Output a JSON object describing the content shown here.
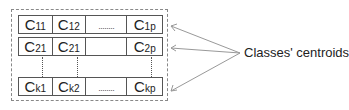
{
  "diagram": {
    "rows": [
      {
        "cells": [
          {
            "base": "C",
            "sub": "11"
          },
          {
            "base": "C",
            "sub": "12"
          },
          {
            "dots": "........"
          },
          {
            "base": "C",
            "sub": "1p"
          }
        ]
      },
      {
        "cells": [
          {
            "base": "C",
            "sub": "21"
          },
          {
            "base": "C",
            "sub": "21"
          },
          {
            "empty": true
          },
          {
            "base": "C",
            "sub": "2p"
          }
        ]
      },
      {
        "cells": [
          {
            "base": "C",
            "sub": "k1"
          },
          {
            "base": "C",
            "sub": "k2"
          },
          {
            "dots": "........"
          },
          {
            "base": "C",
            "sub": "kp"
          }
        ]
      }
    ],
    "label": "Classes' centroids",
    "colors": {
      "box_border": "#555555",
      "dashed_border": "#888888",
      "arrow": "#999999"
    }
  }
}
